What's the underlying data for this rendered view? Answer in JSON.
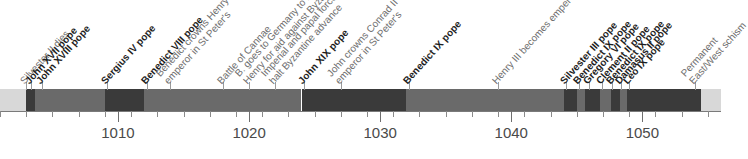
{
  "chart_data": {
    "type": "timeline",
    "title": "",
    "xlabel": "",
    "ylabel": "",
    "xlim": [
      1001,
      1056
    ],
    "grid": false,
    "legend": "none",
    "tick_labels": [
      "1010",
      "1020",
      "1030",
      "1040",
      "1050"
    ],
    "tick_values": [
      1010,
      1020,
      1030,
      1040,
      1050
    ],
    "minor_tick_interval": 2,
    "colors": {
      "segment_dark": "#3a3a3a",
      "segment_mid": "#6a6a6a",
      "segment_light": "#d8d8d8",
      "axis": "#7a7a7a",
      "label_bold": "#1d1d1d",
      "label_plain": "#6e6e6e"
    },
    "segments": [
      {
        "name": "pre-period",
        "start": 1001.0,
        "end": 1003.0,
        "shade": "light"
      },
      {
        "name": "John XVII",
        "start": 1003.0,
        "end": 1003.7,
        "shade": "dark"
      },
      {
        "name": "John XVIII",
        "start": 1003.7,
        "end": 1009.0,
        "shade": "mid"
      },
      {
        "name": "Sergius IV",
        "start": 1009.0,
        "end": 1012.0,
        "shade": "dark"
      },
      {
        "name": "Benedict VIII",
        "start": 1012.0,
        "end": 1024.0,
        "shade": "mid"
      },
      {
        "name": "John XIX",
        "start": 1024.0,
        "end": 1032.0,
        "shade": "dark"
      },
      {
        "name": "Benedict IX first",
        "start": 1032.0,
        "end": 1044.0,
        "shade": "mid"
      },
      {
        "name": "Silvester III",
        "start": 1044.0,
        "end": 1045.0,
        "shade": "dark"
      },
      {
        "name": "Benedict IX second",
        "start": 1045.0,
        "end": 1045.6,
        "shade": "mid"
      },
      {
        "name": "Gregory VI",
        "start": 1045.6,
        "end": 1046.8,
        "shade": "dark"
      },
      {
        "name": "Clement II",
        "start": 1046.8,
        "end": 1047.6,
        "shade": "mid"
      },
      {
        "name": "Benedict IX third",
        "start": 1047.6,
        "end": 1048.3,
        "shade": "dark"
      },
      {
        "name": "Damasus II",
        "start": 1048.3,
        "end": 1048.8,
        "shade": "mid"
      },
      {
        "name": "Leo IX",
        "start": 1048.8,
        "end": 1054.5,
        "shade": "dark"
      },
      {
        "name": "post-period",
        "start": 1054.5,
        "end": 1056.0,
        "shade": "light"
      }
    ],
    "events": [
      {
        "year": 1003.0,
        "label": "Silvester II dies",
        "bold": false
      },
      {
        "year": 1003.4,
        "label": "John XVII pope",
        "bold": true
      },
      {
        "year": 1004.2,
        "label": "John XVIII pope",
        "bold": true
      },
      {
        "year": 1009.2,
        "label": "Sergius IV pope",
        "bold": true
      },
      {
        "year": 1012.2,
        "label": "Benedict VIII pope",
        "bold": true
      },
      {
        "year": 1014.0,
        "label": "Benedict crowns Henry II",
        "label2": "emperor in St Peter's",
        "bold": false
      },
      {
        "year": 1018.0,
        "label": "Battle of Cannae",
        "bold": false
      },
      {
        "year": 1020.0,
        "label": "B. goes to Germany to ask",
        "label2": "Henry for aid against Byzantium",
        "bold": false
      },
      {
        "year": 1022.0,
        "label": "Imperial and papal forces",
        "label2": "halt Byzantine advance",
        "bold": false
      },
      {
        "year": 1024.2,
        "label": "John XIX pope",
        "bold": true
      },
      {
        "year": 1027.0,
        "label": "John crowns Conrad II",
        "label2": "emperor in St Peter's",
        "bold": false
      },
      {
        "year": 1032.2,
        "label": "Benedict IX pope",
        "bold": true
      },
      {
        "year": 1039.0,
        "label": "Henry III becomes emperor",
        "bold": false
      },
      {
        "year": 1044.2,
        "label": "Silvester III pope",
        "bold": true
      },
      {
        "year": 1045.2,
        "label": "Benedict IX pope",
        "bold": true
      },
      {
        "year": 1045.9,
        "label": "Gregory VI pope",
        "bold": true
      },
      {
        "year": 1046.9,
        "label": "Clement II pope",
        "bold": true
      },
      {
        "year": 1047.7,
        "label": "Benedict IX pope",
        "bold": true
      },
      {
        "year": 1048.4,
        "label": "Damasus II pope",
        "bold": true
      },
      {
        "year": 1049.0,
        "label": "Leo IX pope",
        "bold": true
      },
      {
        "year": 1054.0,
        "label": "Permanent",
        "label2": "East/West schism",
        "bold": false
      }
    ]
  }
}
